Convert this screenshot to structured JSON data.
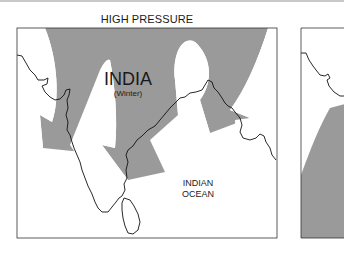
{
  "diagram": {
    "title": "HIGH PRESSURE",
    "panels": [
      {
        "id": "winter",
        "region_label": "INDIA",
        "season_label": "(Winter)",
        "ocean_label_line1": "INDIAN",
        "ocean_label_line2": "OCEAN",
        "arrows": "grey curved wind arrows flowing south-west from high pressure over land toward the ocean"
      },
      {
        "id": "second-panel-partial",
        "note": "cropped panel showing coastline and grey shaded area"
      }
    ],
    "colors": {
      "arrow_fill": "#9a9a9a",
      "coastline": "#111111",
      "frame": "#333333",
      "background": "#ffffff"
    }
  }
}
